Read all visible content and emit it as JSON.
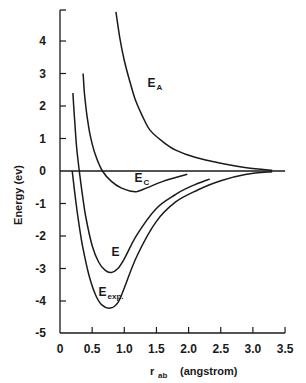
{
  "chart_data": {
    "type": "line",
    "title": "",
    "xlabel": "r_ab (angstrom)",
    "xlabel_main": "r",
    "xlabel_sub": "ab",
    "xlabel_unit": "(angstrom)",
    "ylabel": "Energy (ev)",
    "xlim": [
      0,
      3.5
    ],
    "ylim": [
      -5,
      5
    ],
    "grid": false,
    "legend": "inline labels",
    "x_ticks": [
      0,
      0.5,
      1.0,
      1.5,
      2.0,
      2.5,
      3.0,
      3.5
    ],
    "x_tick_labels": [
      "0",
      "0.5",
      "1.0",
      "1.5",
      "2.0",
      "2.5",
      "3.0",
      "3.5"
    ],
    "y_ticks": [
      4,
      3,
      2,
      1,
      0,
      -1,
      -2,
      -3,
      -4,
      -5
    ],
    "y_tick_labels": [
      "4",
      "3",
      "2",
      "1",
      "0",
      "-1",
      "-2",
      "-3",
      "-4",
      "-5"
    ],
    "zero_line": {
      "x_start": 0,
      "x_end": 3.5,
      "y": 0
    },
    "series": [
      {
        "name": "E_A",
        "label_main": "E",
        "label_sub": "A",
        "label_pos": [
          1.36,
          2.6
        ],
        "points": [
          [
            0.87,
            4.9
          ],
          [
            0.93,
            4.1
          ],
          [
            1.0,
            3.4
          ],
          [
            1.08,
            2.8
          ],
          [
            1.17,
            2.2
          ],
          [
            1.28,
            1.7
          ],
          [
            1.4,
            1.26
          ],
          [
            1.6,
            0.9
          ],
          [
            1.8,
            0.64
          ],
          [
            2.1,
            0.42
          ],
          [
            2.5,
            0.24
          ],
          [
            2.9,
            0.1
          ],
          [
            3.3,
            0.02
          ]
        ]
      },
      {
        "name": "E_C",
        "label_main": "E",
        "label_sub": "C",
        "label_pos": [
          1.16,
          -0.35
        ],
        "points": [
          [
            0.36,
            3.0
          ],
          [
            0.38,
            2.4
          ],
          [
            0.42,
            1.7
          ],
          [
            0.47,
            1.1
          ],
          [
            0.55,
            0.5
          ],
          [
            0.66,
            0.0
          ],
          [
            0.8,
            -0.32
          ],
          [
            0.95,
            -0.52
          ],
          [
            1.1,
            -0.62
          ],
          [
            1.2,
            -0.63
          ],
          [
            1.35,
            -0.52
          ],
          [
            1.6,
            -0.32
          ],
          [
            1.8,
            -0.2
          ],
          [
            1.98,
            -0.1
          ]
        ]
      },
      {
        "name": "E",
        "label_main": "E",
        "label_sub": "",
        "label_pos": [
          0.8,
          -2.6
        ],
        "points": [
          [
            0.2,
            2.4
          ],
          [
            0.23,
            1.5
          ],
          [
            0.26,
            0.7
          ],
          [
            0.3,
            0.0
          ],
          [
            0.35,
            -0.75
          ],
          [
            0.4,
            -1.4
          ],
          [
            0.5,
            -2.3
          ],
          [
            0.6,
            -2.8
          ],
          [
            0.7,
            -3.05
          ],
          [
            0.8,
            -3.12
          ],
          [
            0.9,
            -3.0
          ],
          [
            1.0,
            -2.7
          ],
          [
            1.2,
            -1.95
          ],
          [
            1.5,
            -1.15
          ],
          [
            1.8,
            -0.72
          ],
          [
            1.95,
            -0.55
          ],
          [
            2.15,
            -0.38
          ],
          [
            2.33,
            -0.25
          ]
        ]
      },
      {
        "name": "E_exp",
        "label_main": "E",
        "label_sub": "exp.",
        "label_pos": [
          0.6,
          -3.85
        ],
        "points": [
          [
            0.19,
            0.0
          ],
          [
            0.22,
            -0.5
          ],
          [
            0.25,
            -1.0
          ],
          [
            0.3,
            -1.7
          ],
          [
            0.35,
            -2.3
          ],
          [
            0.45,
            -3.2
          ],
          [
            0.55,
            -3.8
          ],
          [
            0.65,
            -4.12
          ],
          [
            0.78,
            -4.22
          ],
          [
            0.9,
            -4.05
          ],
          [
            1.0,
            -3.6
          ],
          [
            1.2,
            -2.6
          ],
          [
            1.5,
            -1.55
          ],
          [
            1.8,
            -0.95
          ],
          [
            2.15,
            -0.58
          ],
          [
            2.5,
            -0.3
          ],
          [
            2.9,
            -0.1
          ],
          [
            3.3,
            -0.02
          ]
        ]
      }
    ],
    "colors": {
      "line": "#1a1a1a",
      "background": "#ffffff"
    }
  },
  "layout": {
    "x0_px": 60,
    "px_per_x": 64.3,
    "y0_px": 171,
    "px_per_y": 32.5,
    "axis_top_px": 10,
    "axis_bottom_px": 333
  }
}
